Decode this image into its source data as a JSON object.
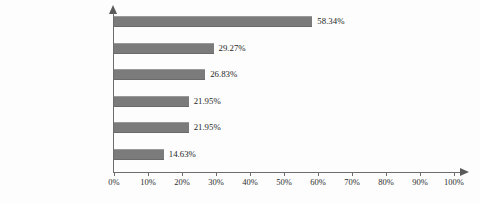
{
  "chart_data": {
    "type": "bar",
    "orientation": "horizontal",
    "title": "",
    "xlabel": "",
    "ylabel": "",
    "xlim": [
      0,
      100
    ],
    "grid": false,
    "legend": null,
    "bar_color": "#7b7b7b",
    "axis_color": "#6d6d6d",
    "value_suffix": "%",
    "categories": [
      "财务与业务集成",
      "产供销数据集成",
      "管理与控制数据集成",
      "设计与制造数据集成",
      "产品与服务管理集成",
      "决策支持集成"
    ],
    "values": [
      58.34,
      29.27,
      26.83,
      21.95,
      21.95,
      14.63
    ],
    "value_labels": [
      "58.34%",
      "29.27%",
      "26.83%",
      "21.95%",
      "21.95%",
      "14.63%"
    ],
    "xticks": [
      0,
      10,
      20,
      30,
      40,
      50,
      60,
      70,
      80,
      90,
      100
    ],
    "xtick_labels": [
      "0%",
      "10%",
      "20%",
      "30%",
      "40%",
      "50%",
      "60%",
      "70%",
      "80%",
      "90%",
      "100%"
    ]
  }
}
